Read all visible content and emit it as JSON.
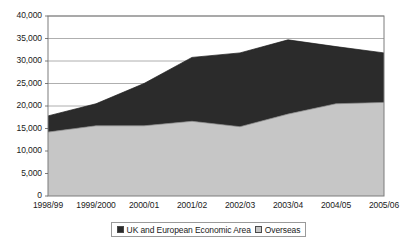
{
  "chart_data": {
    "type": "area",
    "stacked": true,
    "title": "",
    "subtitle": "",
    "xlabel": "",
    "ylabel": "",
    "categories": [
      "1998/99",
      "1999/2000",
      "2000/01",
      "2001/02",
      "2002/03",
      "2003/04",
      "2004/05",
      "2005/06"
    ],
    "series": [
      {
        "name": "UK and European Economic Area",
        "color": "#2b2b2b",
        "values": [
          3600,
          4900,
          9400,
          14200,
          16400,
          16500,
          12700,
          11000
        ]
      },
      {
        "name": "Overseas",
        "color": "#c6c6c6",
        "values": [
          14200,
          15600,
          15600,
          16600,
          15400,
          18200,
          20500,
          20800
        ]
      }
    ],
    "stack_totals": [
      17800,
      20500,
      25000,
      30800,
      31800,
      34700,
      33200,
      31800
    ],
    "ylim": [
      0,
      40000
    ],
    "ytick_values": [
      0,
      5000,
      10000,
      15000,
      20000,
      25000,
      30000,
      35000,
      40000
    ],
    "ytick_labels": [
      "0",
      "5,000",
      "10,000",
      "15,000",
      "20,000",
      "25,000",
      "30,000",
      "35,000",
      "40,000"
    ],
    "grid": true,
    "grid_axis": "y",
    "grid_color": "#9a9a9a",
    "plot_border_color": "#7d7d7d",
    "legend_position": "bottom",
    "legend_entries": [
      {
        "label": "UK and European Economic Area",
        "color": "#2b2b2b"
      },
      {
        "label": "Overseas",
        "color": "#c6c6c6"
      }
    ]
  }
}
